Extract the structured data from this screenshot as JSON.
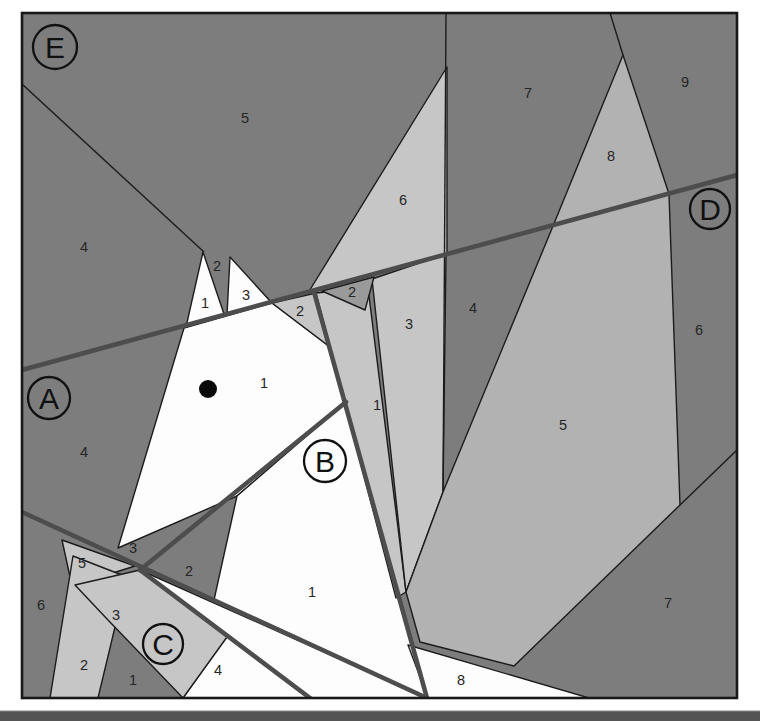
{
  "palette": {
    "page_bg": "#ffffff",
    "dark": "#7d7d7d",
    "light": "#c6c6c6",
    "midlight": "#b2b2b2",
    "medium": "#9a9a9a",
    "white_piece": "#fdfdfd",
    "thin_line": "#1c1c1c",
    "seam_line": "#4d4d4d",
    "border": "#181818",
    "label_color": "#252525",
    "bottom_bar": "#545454",
    "bottom_bar_edge": "#8a8a8a"
  },
  "frame": {
    "x": 22,
    "y": 13,
    "w": 715,
    "h": 685
  },
  "bottom_bar": {
    "x": 0,
    "y": 711,
    "w": 760,
    "h": 10
  },
  "eye": {
    "x": 208,
    "y": 389,
    "r": 9
  },
  "pieces": [
    {
      "name": "piece-face",
      "fill": "white_piece",
      "pts": "184,328 272,303 330,347 346,402 237,496 118,548"
    },
    {
      "name": "piece-ear-1",
      "fill": "white_piece",
      "pts": "186,327 203,252 224,314"
    },
    {
      "name": "piece-ear-3",
      "fill": "white_piece",
      "pts": "230,257 227,315 271,302"
    },
    {
      "name": "piece-neck-1",
      "fill": "white_piece",
      "pts": "237,496 346,402 427,698 214,600"
    },
    {
      "name": "piece-chest-wedge",
      "fill": "white_piece",
      "pts": "140,570 427,698 310,698"
    },
    {
      "name": "piece-c4",
      "fill": "white_piece",
      "pts": "228,635 310,698 183,698"
    },
    {
      "name": "piece-8-bottom",
      "fill": "white_piece",
      "pts": "408,645 589,698 428,698"
    },
    {
      "name": "piece-2-light",
      "fill": "light",
      "pts": "272,303 316,293 330,347"
    },
    {
      "name": "piece-e6",
      "fill": "light",
      "pts": "447,67 447,254 308,293"
    },
    {
      "name": "piece-mane-1",
      "fill": "light",
      "pts": "316,293 368,288 406,592 396,598"
    },
    {
      "name": "piece-d3",
      "fill": "light",
      "pts": "372,279 446,254 443,492 406,592"
    },
    {
      "name": "piece-c5",
      "fill": "light",
      "pts": "62,540 135,566 72,586"
    },
    {
      "name": "piece-c2",
      "fill": "light",
      "pts": "73,556 127,577 98,698 50,698"
    },
    {
      "name": "piece-c3",
      "fill": "light",
      "pts": "75,585 140,570 227,637 183,698 108,620"
    },
    {
      "name": "piece-d8-top",
      "fill": "midlight",
      "pts": "623,55 553,226 669,194"
    },
    {
      "name": "piece-d5",
      "fill": "midlight",
      "pts": "553,226 669,194 680,505 514,666 420,642 406,592 443,492"
    },
    {
      "name": "piece-d2",
      "fill": "medium",
      "pts": "322,291 374,277 365,310"
    }
  ],
  "thin_lines": [
    {
      "name": "line-e4-e5",
      "x1": 22,
      "y1": 84,
      "x2": 204,
      "y2": 252
    },
    {
      "name": "line-vertical",
      "x1": 446,
      "y1": 13,
      "x2": 443,
      "y2": 492
    },
    {
      "name": "line-7-9",
      "x1": 610,
      "y1": 13,
      "x2": 623,
      "y2": 55
    },
    {
      "name": "line-6-7",
      "x1": 680,
      "y1": 505,
      "x2": 737,
      "y2": 450
    }
  ],
  "seams": [
    {
      "name": "seam-top-diagonal",
      "x1": 22,
      "y1": 370,
      "x2": 737,
      "y2": 175
    },
    {
      "name": "seam-mane",
      "x1": 314,
      "y1": 292,
      "x2": 427,
      "y2": 698
    },
    {
      "name": "seam-chest",
      "x1": 346,
      "y1": 402,
      "x2": 140,
      "y2": 570
    },
    {
      "name": "seam-lower-left",
      "x1": 22,
      "y1": 512,
      "x2": 427,
      "y2": 698
    },
    {
      "name": "seam-c-section",
      "x1": 140,
      "y1": 570,
      "x2": 310,
      "y2": 698
    }
  ],
  "sections": [
    {
      "letter": "E",
      "x": 55,
      "y": 47,
      "r": 22
    },
    {
      "letter": "A",
      "x": 49,
      "y": 398,
      "r": 21
    },
    {
      "letter": "B",
      "x": 325,
      "y": 461,
      "r": 21
    },
    {
      "letter": "C",
      "x": 163,
      "y": 644,
      "r": 20
    },
    {
      "letter": "D",
      "x": 710,
      "y": 209,
      "r": 20
    }
  ],
  "numbers": [
    {
      "t": "5",
      "x": 245,
      "y": 118
    },
    {
      "t": "4",
      "x": 84,
      "y": 247
    },
    {
      "t": "2",
      "x": 217,
      "y": 266
    },
    {
      "t": "1",
      "x": 205,
      "y": 303
    },
    {
      "t": "3",
      "x": 246,
      "y": 295
    },
    {
      "t": "2",
      "x": 300,
      "y": 311
    },
    {
      "t": "2",
      "x": 352,
      "y": 292
    },
    {
      "t": "6",
      "x": 403,
      "y": 200
    },
    {
      "t": "3",
      "x": 409,
      "y": 324
    },
    {
      "t": "4",
      "x": 473,
      "y": 308
    },
    {
      "t": "1",
      "x": 377,
      "y": 405
    },
    {
      "t": "7",
      "x": 528,
      "y": 93
    },
    {
      "t": "8",
      "x": 611,
      "y": 156
    },
    {
      "t": "9",
      "x": 685,
      "y": 82
    },
    {
      "t": "6",
      "x": 699,
      "y": 330
    },
    {
      "t": "5",
      "x": 563,
      "y": 425
    },
    {
      "t": "7",
      "x": 668,
      "y": 603
    },
    {
      "t": "8",
      "x": 461,
      "y": 680
    },
    {
      "t": "4",
      "x": 84,
      "y": 452
    },
    {
      "t": "1",
      "x": 264,
      "y": 383
    },
    {
      "t": "3",
      "x": 133,
      "y": 548
    },
    {
      "t": "2",
      "x": 189,
      "y": 571
    },
    {
      "t": "1",
      "x": 312,
      "y": 592
    },
    {
      "t": "5",
      "x": 82,
      "y": 563
    },
    {
      "t": "6",
      "x": 41,
      "y": 605
    },
    {
      "t": "3",
      "x": 116,
      "y": 615
    },
    {
      "t": "2",
      "x": 84,
      "y": 665
    },
    {
      "t": "1",
      "x": 133,
      "y": 680
    },
    {
      "t": "4",
      "x": 218,
      "y": 670
    }
  ]
}
